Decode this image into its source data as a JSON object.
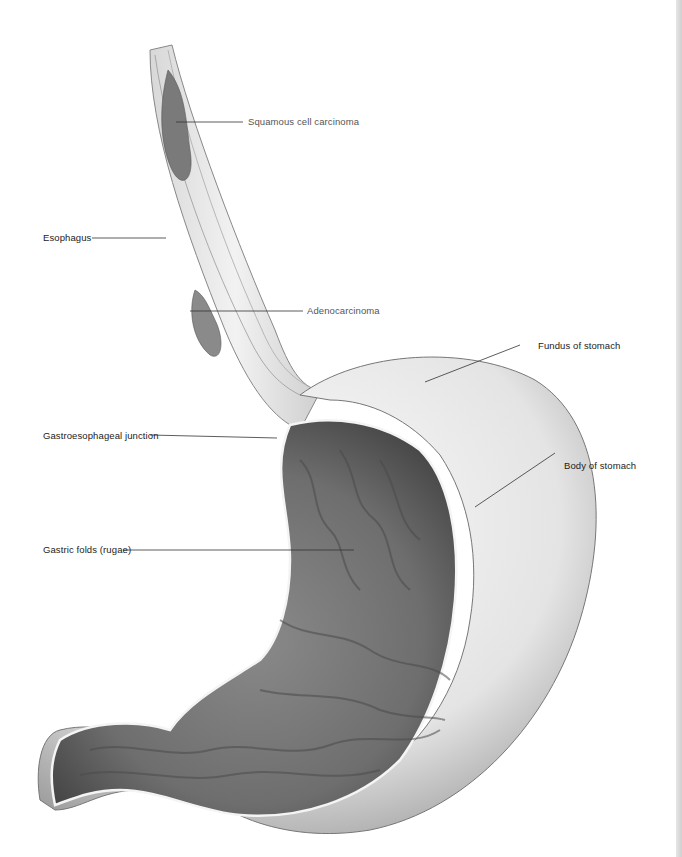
{
  "figure": {
    "labels": {
      "squamous": "Squamous cell carcinoma",
      "esophagus": "Esophagus",
      "adeno": "Adenocarcinoma",
      "fundus": "Fundus of stomach",
      "ge_junction": "Gastroesophageal junction",
      "body": "Body of stomach",
      "rugae": "Gastric folds (rugae)"
    }
  }
}
